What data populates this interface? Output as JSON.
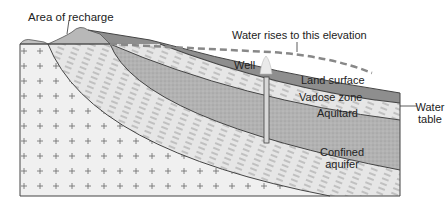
{
  "diagram": {
    "labels": {
      "recharge": "Area of recharge",
      "water_rises": "Water rises to this elevation",
      "well": "Well",
      "land_surface": "Land surface",
      "vadose_zone": "Vadose zone",
      "water_table_line1": "Water",
      "water_table_line2": "table",
      "aquitard": "Aquitard",
      "confined_line1": "Confined",
      "confined_line2": "aquifer"
    },
    "colors": {
      "bedrock": "#f0f0f0",
      "aquitard": "#e4e4e4",
      "aquifer": "#b4b4b4",
      "vadose": "#8c8c8c",
      "outline": "#444444",
      "dash": "#888888"
    }
  }
}
